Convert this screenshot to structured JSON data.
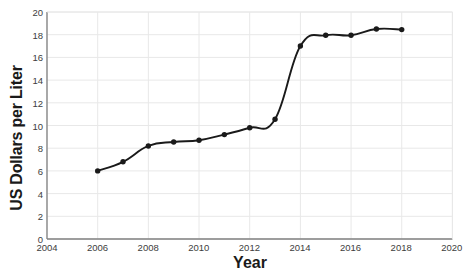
{
  "chart_data": {
    "type": "line",
    "title": "",
    "xlabel": "Year",
    "ylabel": "US Dollars per Liter",
    "xlim": [
      2004,
      2020
    ],
    "ylim": [
      0,
      20
    ],
    "xticks": [
      2004,
      2006,
      2008,
      2010,
      2012,
      2014,
      2016,
      2018,
      2020
    ],
    "yticks": [
      0,
      2,
      4,
      6,
      8,
      10,
      12,
      14,
      16,
      18,
      20
    ],
    "grid": true,
    "legend_position": "none",
    "x": [
      2006,
      2007,
      2008,
      2009,
      2010,
      2011,
      2012,
      2013,
      2014,
      2015,
      2016,
      2017,
      2018
    ],
    "values": [
      6.0,
      6.8,
      8.2,
      8.55,
      8.7,
      9.2,
      9.8,
      10.55,
      17.0,
      17.95,
      17.95,
      18.5,
      18.45
    ],
    "series": [
      {
        "name": "US Dollars per Liter",
        "values": [
          6.0,
          6.8,
          8.2,
          8.55,
          8.7,
          9.2,
          9.8,
          10.55,
          17.0,
          17.95,
          17.95,
          18.5,
          18.45
        ]
      }
    ],
    "marker": "circle",
    "line_color": "#1a1a1a",
    "marker_color": "#1a1a1a",
    "grid_color": "#e8e8e8",
    "axis_color": "#9a9a9a",
    "annotations": []
  },
  "axis_labels": {
    "y_title": "US Dollars per Liter",
    "x_title": "Year"
  },
  "ytick_labels": [
    "20",
    "18",
    "16",
    "14",
    "12",
    "10",
    "8",
    "6",
    "4",
    "2",
    "0"
  ],
  "xtick_labels": [
    "2004",
    "2006",
    "2008",
    "2010",
    "2012",
    "2014",
    "2016",
    "2018",
    "2020"
  ]
}
